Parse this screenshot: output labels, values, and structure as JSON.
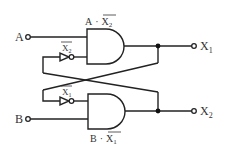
{
  "diagram": {
    "type": "logic-circuit",
    "inputs": {
      "a": {
        "label": "A"
      },
      "b": {
        "label": "B"
      }
    },
    "outputs": {
      "x1": {
        "label": "X",
        "sub": "1"
      },
      "x2": {
        "label": "X",
        "sub": "2"
      }
    },
    "gates": {
      "top_and": {
        "expr_left": "A",
        "dot": "·",
        "expr_bar": "X",
        "expr_sub": "2"
      },
      "bottom_and": {
        "expr_left": "B",
        "dot": "·",
        "expr_bar": "X",
        "expr_sub": "1"
      }
    },
    "inverters": {
      "top": {
        "label": "X",
        "sub": "2"
      },
      "bottom": {
        "label": "X",
        "sub": "1"
      }
    },
    "colors": {
      "line": "#222222",
      "text": "#333333",
      "background": "#ffffff"
    }
  }
}
